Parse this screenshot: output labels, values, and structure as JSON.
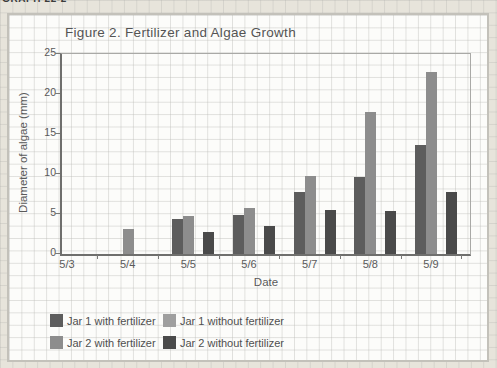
{
  "page": {
    "header_label": "GRAPH 22-2"
  },
  "chart": {
    "title": "Figure 2. Fertilizer and Algae Growth",
    "y_axis": {
      "label": "Diameter of algae (mm)",
      "ticks": [
        25,
        20,
        15,
        10,
        5,
        0
      ]
    },
    "x_axis": {
      "label": "Date"
    }
  },
  "chart_data": {
    "type": "bar",
    "title": "Figure 2. Fertilizer and Algae Growth",
    "categories": [
      "5/3",
      "5/4",
      "5/5",
      "5/6",
      "5/7",
      "5/8",
      "5/9"
    ],
    "series": [
      {
        "name": "Jar 1 with fertilizer",
        "color": "#5d5d5d",
        "values": [
          0,
          0,
          4.4,
          4.9,
          7.8,
          9.6,
          13.6
        ]
      },
      {
        "name": "Jar 1 without fertilizer",
        "color": "#9f9f9f",
        "values": [
          0,
          0,
          0,
          0,
          0,
          0,
          0
        ]
      },
      {
        "name": "Jar 2 with fertilizer",
        "color": "#8d8d8d",
        "values": [
          0,
          3.1,
          4.7,
          5.7,
          9.7,
          17.8,
          22.7
        ]
      },
      {
        "name": "Jar 2 without fertilizer",
        "color": "#4a4a4a",
        "values": [
          0,
          0,
          2.7,
          3.5,
          5.5,
          5.4,
          7.7
        ]
      }
    ],
    "xlabel": "Date",
    "ylabel": "Diameter of algae (mm)",
    "ylim": [
      0,
      25
    ],
    "y_ticks": [
      0,
      5,
      10,
      15,
      20,
      25
    ],
    "grid": "graph-paper page background, no dedicated chart gridlines",
    "legend_position": "below plot, 2 rows x 2 columns",
    "bar_layout": "per date: 'Jar 1 with' and 'Jar 2 with' adjacent, one empty slot ('Jar 1 without' = 0), then 'Jar 2 without'"
  }
}
